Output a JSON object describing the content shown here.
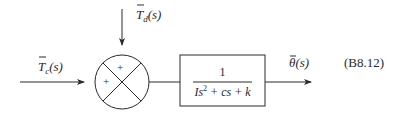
{
  "diagram": {
    "type": "block-diagram",
    "inputs": {
      "control_torque": {
        "label_base": "T",
        "label_sub": "c",
        "label_arg": "(s)",
        "display": "T̄c(s)"
      },
      "disturbance_torque": {
        "label_base": "T",
        "label_sub": "d",
        "label_arg": "(s)",
        "display": "T̄d(s)"
      }
    },
    "summing_junction": {
      "signs": {
        "top": "+",
        "left": "+"
      }
    },
    "transfer_block": {
      "numerator": "1",
      "denominator_parts": {
        "I": "I",
        "s": "s",
        "exp": "2",
        "rest": " + cs + k"
      },
      "display": "1 / (Is² + cs + k)"
    },
    "output": {
      "label_base": "θ",
      "label_arg": "(s)",
      "display": "θ̄(s)"
    },
    "equation_number": "(B8.12)",
    "colors": {
      "stroke": "#2a2a2a",
      "background": "#ffffff"
    }
  }
}
